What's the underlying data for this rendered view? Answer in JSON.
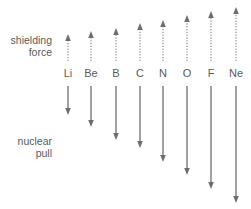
{
  "labels": {
    "shielding_line1": "shielding",
    "shielding_line2": "force",
    "nuclear_line1": "nuclear",
    "nuclear_line2": "pull"
  },
  "colors": {
    "arrow": "#6e6e6e",
    "text": "#5a5a5a"
  },
  "elements": [
    {
      "symbol": "Li",
      "x": 68,
      "shield_top": 34,
      "pull_bottom": 115
    },
    {
      "symbol": "Be",
      "x": 91,
      "shield_top": 31,
      "pull_bottom": 127
    },
    {
      "symbol": "B",
      "x": 116,
      "shield_top": 28,
      "pull_bottom": 140
    },
    {
      "symbol": "C",
      "x": 140,
      "shield_top": 23,
      "pull_bottom": 148
    },
    {
      "symbol": "N",
      "x": 163,
      "shield_top": 20,
      "pull_bottom": 162
    },
    {
      "symbol": "O",
      "x": 187,
      "shield_top": 15,
      "pull_bottom": 175
    },
    {
      "symbol": "F",
      "x": 211,
      "shield_top": 11,
      "pull_bottom": 189
    },
    {
      "symbol": "Ne",
      "x": 236,
      "shield_top": 7,
      "pull_bottom": 203
    }
  ]
}
